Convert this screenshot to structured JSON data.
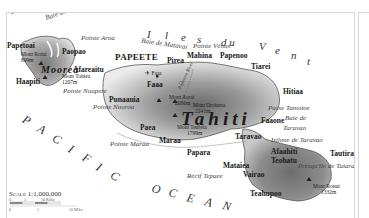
{
  "map": {
    "islands": {
      "tahiti": "Tahiti",
      "moorea": "Moorea",
      "presquile": "Presqu'île de Taiarapu"
    },
    "capital": "PAPEETE",
    "towns": {
      "papetoai": "Papetoai",
      "paopao": "Paopao",
      "afareaitu": "Afareaitu",
      "haapiti": "Haapiti",
      "pirea": "Pirea",
      "mahina": "Mahina",
      "papenoo": "Papenoo",
      "tiarei": "Tiarei",
      "hitiaa": "Hitiaa",
      "faaa": "Faaa",
      "punaauia": "Punaauia",
      "paea": "Paea",
      "maraa": "Maraa",
      "papara": "Papara",
      "mataiea": "Mataiea",
      "vairao": "Vairao",
      "teahupoo": "Teahupoo",
      "afaahiti": "Afaahiti",
      "taravao": "Taravao",
      "faaone": "Faaone",
      "teohatu": "Teohatu",
      "tautira": "Tautira"
    },
    "features": {
      "baie_opunohu": "Baie d' Opunohu",
      "baie_cook": "Baie de Cook",
      "pointe_aroa": "Pointe Aroa",
      "baie_matavai": "Baie de Matavai",
      "pointe_venus": "Pointe Vénus",
      "pointe_nuupere": "Pointe Nuupere",
      "pointe_nuuroa": "Pointe Nuuroa",
      "pointe_maraa": "Pointe Maraa",
      "passe_tamotoe": "Passe Tamotoe",
      "baie_taravao_1": "Baie de",
      "baie_taravao_2": "Taravao",
      "isthme_taravao": "Isthme de Taravao",
      "recif_tepaee": "Récif Tepaee",
      "papenoo_river": "Papenoo River",
      "airport": "Faaa"
    },
    "peaks": {
      "mont_rotui": "Mont Rotui",
      "mont_rotui_elev": "899m",
      "mont_tohiea": "Mont Tohiea",
      "mont_tohiea_elev": "1207m",
      "mont_aorai": "Mont Aorai",
      "mont_aorai_elev": "2066m",
      "mont_orohena": "Mont Orohena",
      "mont_orohena_elev": "2241m",
      "mont_teufeta": "Mont Teufeta",
      "mont_teufeta_elev": "1799m",
      "mont_ronui": "Mont Ronui",
      "mont_ronui_elev": "1332m"
    },
    "sea_labels": {
      "iles": [
        "I",
        "l",
        "e",
        "s"
      ],
      "du": "d u",
      "vent": [
        "V",
        "e",
        "n",
        "t"
      ],
      "pacific": [
        "P",
        "A",
        "C",
        "I",
        "F",
        "I",
        "C"
      ],
      "ocean": [
        "O",
        "C",
        "E",
        "A",
        "N"
      ]
    },
    "scale": {
      "title": "Scale 1:1,000,000",
      "km_ticks": [
        "0",
        "5",
        "10 Kilos"
      ],
      "mi_ticks": [
        "0",
        "5",
        "10 Miles"
      ],
      "note": "Kilometers / Miles"
    },
    "colors": {
      "land_light": "#e9e9e9",
      "land_mid": "#a9a9a9",
      "land_dark": "#6e6e6e",
      "coast": "#555555",
      "water": "#ffffff",
      "border": "#d8d8d8"
    }
  }
}
